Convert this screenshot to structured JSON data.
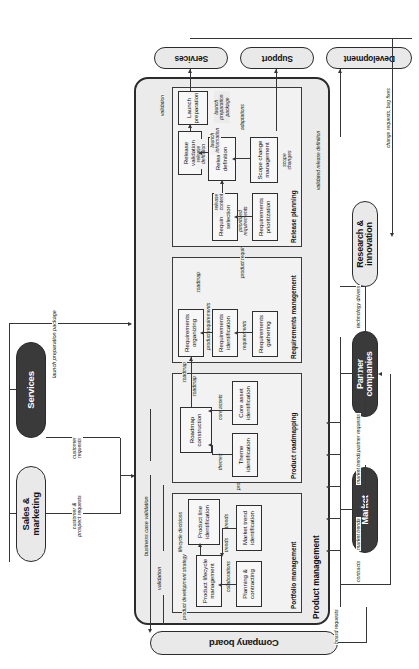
{
  "figure": {
    "orientation": "rotated-90"
  },
  "actors": [
    {
      "id": "company-board",
      "label": "Company board",
      "fill": "light",
      "side": "left"
    },
    {
      "id": "sales-marketing",
      "label": "Sales &\nmarketing",
      "fill": "light",
      "side": "top"
    },
    {
      "id": "customer",
      "label": "Customer",
      "fill": "dark",
      "side": "top"
    },
    {
      "id": "services",
      "label": "Services",
      "fill": "light",
      "side": "right"
    },
    {
      "id": "support",
      "label": "Support",
      "fill": "light",
      "side": "right"
    },
    {
      "id": "development",
      "label": "Development",
      "fill": "light",
      "side": "right"
    },
    {
      "id": "market",
      "label": "Market",
      "fill": "dark",
      "side": "bottom"
    },
    {
      "id": "partner-companies",
      "label": "Partner\ncompanies",
      "fill": "dark",
      "side": "bottom"
    },
    {
      "id": "research-innovation",
      "label": "Research &\ninnovation",
      "fill": "light",
      "side": "bottom"
    }
  ],
  "container": {
    "label": "Product management",
    "color": "#ebebeb"
  },
  "groups": [
    {
      "id": "portfolio-management",
      "label": "Portfolio management",
      "activities": [
        {
          "id": "planning-contracting",
          "label": "Planning &\ncontracting"
        },
        {
          "id": "market-trend-identification",
          "label": "Market trend\nidentification"
        },
        {
          "id": "product-lifecycle-management",
          "label": "Product lifecycle\nmanagement"
        },
        {
          "id": "product-line-identification",
          "label": "Product line\nidentification"
        }
      ]
    },
    {
      "id": "product-roadmapping",
      "label": "Product roadmapping",
      "activities": [
        {
          "id": "theme-identification",
          "label": "Theme\nidentification"
        },
        {
          "id": "core-asset-identification",
          "label": "Core asset\nidentification"
        },
        {
          "id": "roadmap-construction",
          "label": "Roadmap\nconstruction"
        }
      ]
    },
    {
      "id": "requirements-management",
      "label": "Requirements management",
      "activities": [
        {
          "id": "requirements-gathering",
          "label": "Requirements\ngathering"
        },
        {
          "id": "requirements-identification",
          "label": "Requirements\nidentification"
        },
        {
          "id": "requirements-organizing",
          "label": "Requirements\norganizing"
        }
      ]
    },
    {
      "id": "release-planning",
      "label": "Release planning",
      "activities": [
        {
          "id": "requirements-prioritization",
          "label": "Requirements\nprioritization"
        },
        {
          "id": "requirements-selection",
          "label": "Requirements\nselection"
        },
        {
          "id": "scope-change-management",
          "label": "Scope change\nmanagement"
        },
        {
          "id": "release-definition",
          "label": "Release\ndefinition"
        },
        {
          "id": "release-validation",
          "label": "Release\nvalidation"
        },
        {
          "id": "launch-preparation",
          "label": "Launch\npreparation"
        }
      ]
    }
  ],
  "flow_labels": {
    "customer_prospect_requests": "customer &\nprospect requests",
    "customer_requests": "customer\nrequests",
    "launch_preparation_package_top": "launch preparation package",
    "business_case_validation": "business case validation",
    "validation_top": "validation",
    "product_development_strategy": "product development strategy",
    "collaborations": "collaborations",
    "trends_a": "trends",
    "trends_b": "trends",
    "lifecycle_decisions": "lifecycle decisions",
    "product_lines": "product lines",
    "themes": "themes",
    "core_assets": "core assets",
    "roadmap_a": "roadmap",
    "roadmap_b": "roadmap",
    "roadmap_c": "roadmap",
    "requirements": "requirements",
    "product_requirements": "product requirements",
    "product_requirements_list": "product requirements list",
    "prioritized_requirements": "prioritized\nrequirements",
    "release_content": "release\ncontent",
    "release_definition": "release\ndefinition",
    "scope_changes": "scope\nchanges",
    "adaptations": "adaptations",
    "launch_information": "launch\ninformation",
    "launch_preparation_package": "launch\npreparation\npackage",
    "validation_release": "validation",
    "validated_release_definition": "validated release definition",
    "change_requests_bug_fixes": "change requests, bug fixes",
    "board_requests": "board requests",
    "contracts": "contracts",
    "market_trends_left": "market trends",
    "market_trends_mid": "market trends",
    "partner_requests": "partner requests",
    "technology_drivers": "technology drivers"
  },
  "colors": {
    "container_fill": "#ebebeb",
    "group_fill": "#f2f2f2",
    "activity_fill": "#f7f7f7",
    "actor_light": "#e9e9e9",
    "actor_dark": "#3a3a3a",
    "line": "#35353a",
    "border": "#2b2b2b"
  }
}
